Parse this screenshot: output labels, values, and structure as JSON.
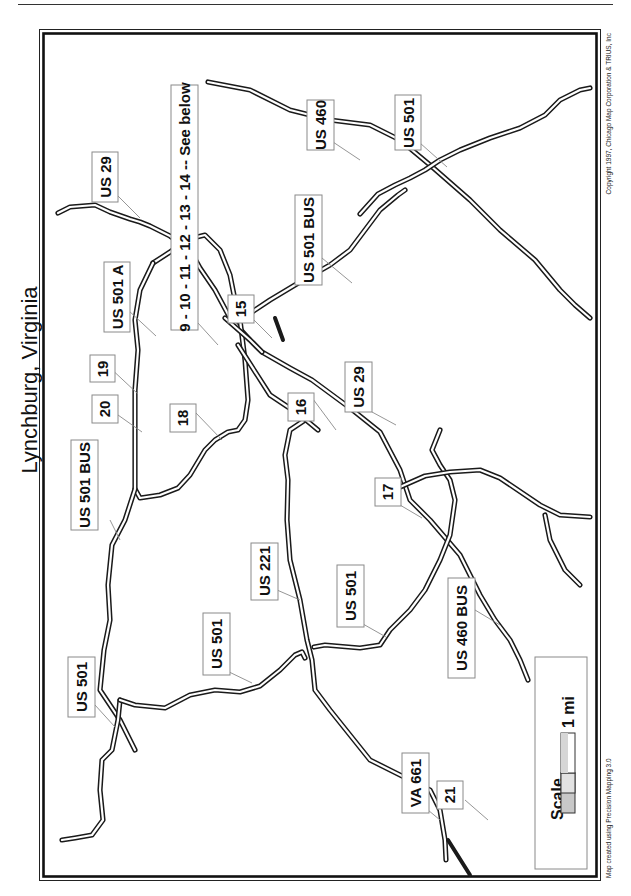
{
  "map": {
    "title": "Lynchburg, Virginia",
    "orientation": "rotated-90-ccw",
    "copyright": "Copyright 1997, Chicago Map Corporation & TRIUS, Inc",
    "credit": "Map created using Precision Mapping 3.0",
    "scale": {
      "label": "Scale",
      "distance": "1 mi"
    },
    "labels": [
      {
        "id": "us29-north",
        "text": "US 29"
      },
      {
        "id": "exits-9-14",
        "text": "9 - 10 - 11 - 12 - 13 - 14 -- See below"
      },
      {
        "id": "us460-east",
        "text": "US 460"
      },
      {
        "id": "us501-east",
        "text": "US 501"
      },
      {
        "id": "us501a",
        "text": "US 501 A"
      },
      {
        "id": "exit-19",
        "text": "19"
      },
      {
        "id": "exit-20",
        "text": "20"
      },
      {
        "id": "exit-18",
        "text": "18"
      },
      {
        "id": "exit-15",
        "text": "15"
      },
      {
        "id": "us501bus-east",
        "text": "US 501 BUS"
      },
      {
        "id": "us501bus-west",
        "text": "US 501 BUS"
      },
      {
        "id": "exit-16",
        "text": "16"
      },
      {
        "id": "us29-south",
        "text": "US 29"
      },
      {
        "id": "exit-17",
        "text": "17"
      },
      {
        "id": "us221",
        "text": "US 221"
      },
      {
        "id": "us501-mid",
        "text": "US 501"
      },
      {
        "id": "us501-center",
        "text": "US 501"
      },
      {
        "id": "us460bus",
        "text": "US 460 BUS"
      },
      {
        "id": "us501-west",
        "text": "US 501"
      },
      {
        "id": "va661",
        "text": "VA 661"
      },
      {
        "id": "exit-21",
        "text": "21"
      }
    ]
  }
}
